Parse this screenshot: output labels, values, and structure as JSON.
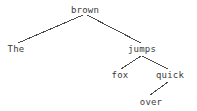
{
  "diagram": {
    "type": "syntax-tree",
    "title": "",
    "background_color": "#ffffff",
    "text_color": "#3a3a3a",
    "edge_color": "#4a4a4a",
    "sentence": "The quick brown fox jumps over",
    "root": "brown",
    "nodes": [
      {
        "id": "brown",
        "label": "brown",
        "x": 85,
        "y": 10,
        "depth": 0
      },
      {
        "id": "the",
        "label": "The",
        "x": 16,
        "y": 49,
        "depth": 1
      },
      {
        "id": "jumps",
        "label": "jumps",
        "x": 142,
        "y": 49,
        "depth": 1
      },
      {
        "id": "fox",
        "label": "fox",
        "x": 120,
        "y": 75,
        "depth": 2
      },
      {
        "id": "quick",
        "label": "quick",
        "x": 170,
        "y": 75,
        "depth": 2
      },
      {
        "id": "over",
        "label": "over",
        "x": 151,
        "y": 102,
        "depth": 3
      }
    ],
    "edges": [
      {
        "from": "brown",
        "to": "the",
        "x1": 83,
        "y1": 15,
        "x2": 18,
        "y2": 43
      },
      {
        "from": "brown",
        "to": "jumps",
        "x1": 87,
        "y1": 15,
        "x2": 141,
        "y2": 43
      },
      {
        "from": "jumps",
        "to": "fox",
        "x1": 141,
        "y1": 56,
        "x2": 121,
        "y2": 69
      },
      {
        "from": "jumps",
        "to": "quick",
        "x1": 142,
        "y1": 56,
        "x2": 168,
        "y2": 69
      },
      {
        "from": "quick",
        "to": "over",
        "x1": 168,
        "y1": 82,
        "x2": 150,
        "y2": 95
      }
    ]
  }
}
